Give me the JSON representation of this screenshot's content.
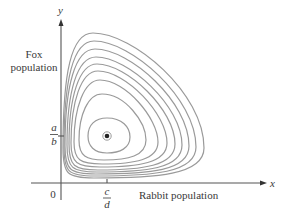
{
  "diagram": {
    "y_axis": {
      "symbol": "y",
      "label_line1": "Fox",
      "label_line2": "population"
    },
    "x_axis": {
      "symbol": "x",
      "label": "Rabbit population"
    },
    "origin_label": "0",
    "y_tick": {
      "numerator": "a",
      "denominator": "b"
    },
    "x_tick": {
      "numerator": "c",
      "denominator": "d"
    },
    "equilibrium": {
      "x_label": "c/d",
      "y_label": "a/b"
    },
    "colors": {
      "axes": "#555555",
      "curves": "#9a9a9a",
      "text": "#3a3a3a",
      "point": "#222222"
    },
    "num_orbits": 9
  }
}
